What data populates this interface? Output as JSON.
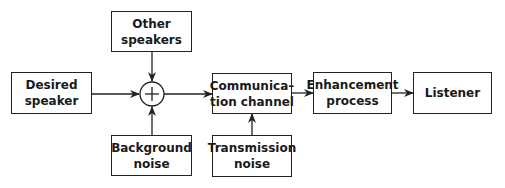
{
  "diagram": {
    "type": "block-diagram",
    "nodes": {
      "desired_speaker": {
        "label_line1": "Desired",
        "label_line2": "speaker"
      },
      "other_speakers": {
        "label_line1": "Other",
        "label_line2": "speakers"
      },
      "background_noise": {
        "label_line1": "Background",
        "label_line2": "noise"
      },
      "summer": {
        "symbol": "+"
      },
      "communication_channel": {
        "label_line1": "Communica–",
        "label_line2": "tion channel"
      },
      "transmission_noise": {
        "label_line1": "Transmission",
        "label_line2": "noise"
      },
      "enhancement_process": {
        "label_line1": "Enhancement",
        "label_line2": "process"
      },
      "listener": {
        "label": "Listener"
      }
    },
    "edges": [
      {
        "from": "desired_speaker",
        "to": "summer"
      },
      {
        "from": "other_speakers",
        "to": "summer"
      },
      {
        "from": "background_noise",
        "to": "summer"
      },
      {
        "from": "summer",
        "to": "communication_channel"
      },
      {
        "from": "transmission_noise",
        "to": "communication_channel"
      },
      {
        "from": "communication_channel",
        "to": "enhancement_process"
      },
      {
        "from": "enhancement_process",
        "to": "listener"
      }
    ],
    "colors": {
      "line": "#222222",
      "background": "#ffffff"
    }
  }
}
